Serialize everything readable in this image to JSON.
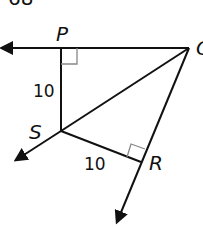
{
  "figure": {
    "top_fragment": "68",
    "labels": {
      "P": "P",
      "Q": "Q",
      "S": "S",
      "R": "R"
    },
    "lengths": {
      "PS": "10",
      "SR": "10"
    },
    "right_angles": [
      "P",
      "R"
    ],
    "colors": {
      "stroke": "#111111",
      "right_angle_marker": "#888888",
      "background": "#ffffff"
    }
  }
}
